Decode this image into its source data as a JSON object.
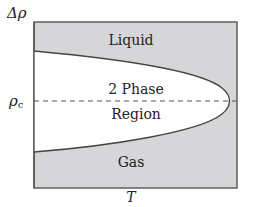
{
  "diagram": {
    "y_axis_label": "Δρ",
    "x_axis_label": "T",
    "critical_label_main": "ρ",
    "critical_label_sub": "c",
    "regions": {
      "liquid": "Liquid",
      "two_phase_line1": "2 Phase",
      "two_phase_line2": "Region",
      "gas": "Gas"
    },
    "colors": {
      "region_fill": "#d6d6d8",
      "two_phase_fill": "#ffffff",
      "border": "#555555",
      "curve": "#444444",
      "dashed_line": "#555555",
      "text": "#222222"
    }
  }
}
